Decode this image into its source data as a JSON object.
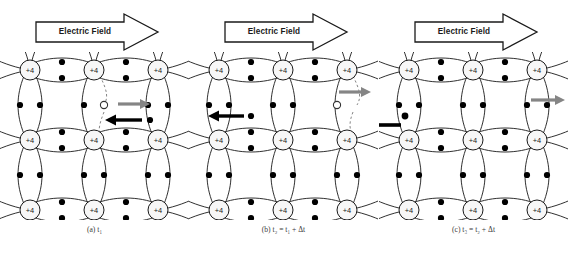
{
  "figure": {
    "background_color": "#ffffff",
    "line_color": "#1a1a1a",
    "electron_color": "#000000",
    "hole_fill": "#ffffff",
    "gray_arrow_color": "#808080",
    "atom_fill": "#f7f7f7"
  },
  "banner": {
    "label": "Electric Field",
    "direction": "right",
    "icon": "block-arrow-right-icon"
  },
  "atom": {
    "core_label": "+4",
    "rows": 3,
    "cols": 3
  },
  "panels": [
    {
      "id": "a",
      "caption_prefix": "(a)",
      "caption_var": "t",
      "caption_sub": "1",
      "caption_rest": "",
      "caption_full": "(a) t₁",
      "hole": {
        "present": true,
        "x": 104,
        "y": 105,
        "label": "hole"
      },
      "gray_arrow": {
        "present": true,
        "x1": 118,
        "x2": 148,
        "y": 104,
        "label": "hole-motion-arrow"
      },
      "black_arrow": {
        "present": true,
        "x1": 142,
        "x2": 108,
        "y": 120,
        "label": "electron-motion-arrow"
      },
      "moving_electron": {
        "present": true,
        "x": 150,
        "y": 120
      },
      "broken_bond": {
        "present": true,
        "x": 104,
        "y_top": 82,
        "y_bot": 134
      }
    },
    {
      "id": "b",
      "caption_prefix": "(b)",
      "caption_var": "t",
      "caption_sub": "2",
      "caption_rest": " = t₁ + Δt",
      "caption_full": "(b) t₂ = t₁ + Δt",
      "hole": {
        "present": true,
        "x": 142,
        "y": 105,
        "label": "hole"
      },
      "gray_arrow": {
        "present": true,
        "x1": 144,
        "x2": 174,
        "y": 92,
        "label": "hole-motion-arrow"
      },
      "black_arrow": {
        "present": true,
        "x1": 55,
        "x2": 22,
        "y": 117,
        "label": "electron-motion-arrow"
      },
      "moving_electron": {
        "present": true,
        "x": 62,
        "y": 117
      },
      "broken_bond": {
        "present": true,
        "x": 142,
        "y_top": 82,
        "y_bot": 134
      }
    },
    {
      "id": "c",
      "caption_prefix": "(c)",
      "caption_var": "t",
      "caption_sub": "3",
      "caption_rest": " = t₂ + Δt",
      "caption_full": "(c) t₃ = t₂ + Δt",
      "hole": {
        "present": false
      },
      "gray_arrow": {
        "present": true,
        "x1": 152,
        "x2": 186,
        "y": 100,
        "label": "hole-exit-arrow"
      },
      "black_arrow": {
        "present": true,
        "x1": 20,
        "x2": -10,
        "y": 125,
        "label": "electron-exit-arrow"
      },
      "moving_electron": {
        "present": true,
        "x": 26,
        "y": 119
      },
      "broken_bond": {
        "present": false
      }
    }
  ]
}
